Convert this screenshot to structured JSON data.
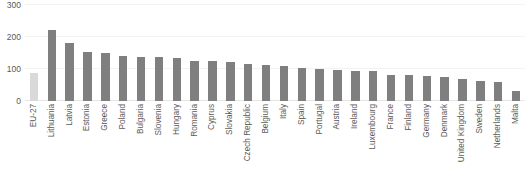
{
  "chart_data": {
    "type": "bar",
    "title": "",
    "subtitle": "",
    "xlabel": "",
    "ylabel": "",
    "ylim": [
      0,
      300
    ],
    "yticks": [
      0,
      100,
      200,
      300
    ],
    "ytick_labels": [
      "0",
      "100",
      "200",
      "300"
    ],
    "grid": true,
    "grid_axis": "y",
    "legend": false,
    "legend_position": "none",
    "orientation": "vertical",
    "categories": [
      "EU-27",
      "Lithuania",
      "Latvia",
      "Estonia",
      "Greece",
      "Poland",
      "Bulgaria",
      "Slovenia",
      "Hungary",
      "Romania",
      "Cyprus",
      "Slovakia",
      "Czech Republic",
      "Belgium",
      "Italy",
      "Spain",
      "Portugal",
      "Austria",
      "Ireland",
      "Luxembourg",
      "France",
      "Finland",
      "Germany",
      "Denmark",
      "United Kingdom",
      "Sweden",
      "Netherlands",
      "Malta"
    ],
    "values": [
      88,
      222,
      180,
      152,
      150,
      140,
      138,
      137,
      133,
      126,
      124,
      122,
      115,
      113,
      110,
      104,
      101,
      98,
      95,
      93,
      82,
      80,
      78,
      74,
      68,
      62,
      60,
      31
    ],
    "series": [
      {
        "name": "Country values",
        "color": "#7f7f7f"
      },
      {
        "name": "EU aggregate",
        "color": "#d9d9d9"
      }
    ],
    "point_styles": [
      "aggregate",
      "main",
      "main",
      "main",
      "main",
      "main",
      "main",
      "main",
      "main",
      "main",
      "main",
      "main",
      "main",
      "main",
      "main",
      "main",
      "main",
      "main",
      "main",
      "main",
      "main",
      "main",
      "main",
      "main",
      "main",
      "main",
      "main",
      "main"
    ],
    "colors": {
      "bar_main": "#7f7f7f",
      "bar_aggregate": "#d9d9d9",
      "gridline": "#f2f2f2",
      "baseline": "#e6e6e6",
      "text": "#5a5a5a",
      "background": "#ffffff"
    }
  }
}
